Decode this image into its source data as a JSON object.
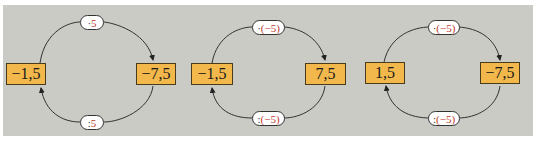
{
  "colors": {
    "background": "#c9cbc4",
    "box_fill": "#f2b84b",
    "pill_fill": "#ffffff",
    "operand_color": "#c0392b",
    "line_color": "#333333"
  },
  "diagrams": [
    {
      "left_value": "−1,5",
      "right_value": "−7,5",
      "top_op": {
        "operator": "·",
        "operand": "5"
      },
      "bottom_op": {
        "operator": ":",
        "operand": "5"
      }
    },
    {
      "left_value": "−1,5",
      "right_value": "7,5",
      "top_op": {
        "operator": "·",
        "operand": "(−5)"
      },
      "bottom_op": {
        "operator": ":",
        "operand": "(−5)"
      }
    },
    {
      "left_value": "1,5",
      "right_value": "−7,5",
      "top_op": {
        "operator": "·",
        "operand": "(−5)"
      },
      "bottom_op": {
        "operator": ":",
        "operand": "(−5)"
      }
    }
  ]
}
